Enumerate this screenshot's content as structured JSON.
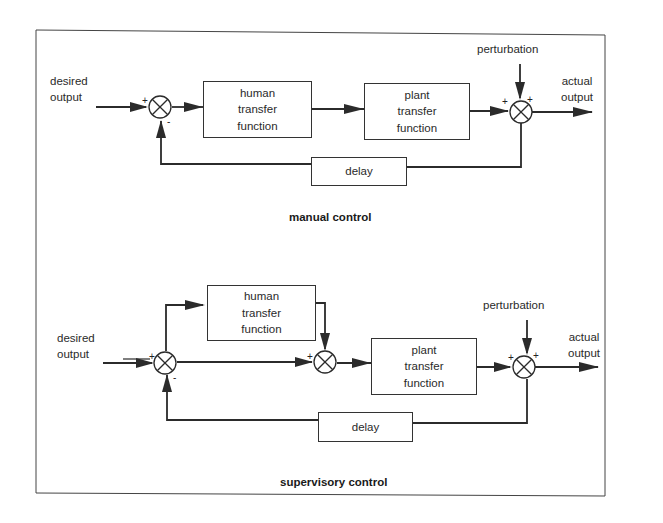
{
  "manual": {
    "title": "manual control",
    "input_label_1": "desired",
    "input_label_2": "output",
    "human_box": [
      "human",
      "transfer",
      "function"
    ],
    "plant_box": [
      "plant",
      "transfer",
      "function"
    ],
    "delay_box": "delay",
    "perturbation": "perturbation",
    "output_label_1": "actual",
    "output_label_2": "output",
    "sum1_signs": {
      "left": "+",
      "bottom": "-"
    },
    "sum2_signs": {
      "left": "+",
      "top": "+"
    }
  },
  "supervisory": {
    "title": "supervisory control",
    "input_label_1": "desired",
    "input_label_2": "output",
    "human_box": [
      "human",
      "transfer",
      "function"
    ],
    "plant_box": [
      "plant",
      "transfer",
      "function"
    ],
    "delay_box": "delay",
    "perturbation": "perturbation",
    "output_label_1": "actual",
    "output_label_2": "output",
    "sum1_signs": {
      "left": "+",
      "bottom": "-"
    },
    "sum2_signs": {
      "left": "+"
    },
    "sum3_signs": {
      "left": "+",
      "top": "+"
    }
  },
  "colors": {
    "line": "#2b2b2b",
    "background": "#ffffff"
  }
}
